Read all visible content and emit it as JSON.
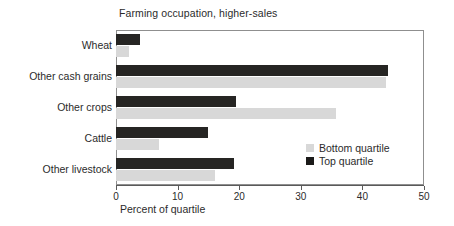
{
  "chart_data": {
    "type": "bar",
    "orientation": "horizontal",
    "title": "Farming occupation, higher-sales",
    "xlabel": "Percent of quartile",
    "ylabel": "",
    "xlim": [
      0,
      50
    ],
    "xticks": [
      0,
      10,
      20,
      30,
      40,
      50
    ],
    "xtick_labels": [
      "0",
      "10",
      "20",
      "30",
      "40",
      "50"
    ],
    "grid": false,
    "legend_position": "inside-right-lower",
    "categories": [
      "Wheat",
      "Other cash grains",
      "Other crops",
      "Cattle",
      "Other livestock"
    ],
    "series": [
      {
        "name": "Top quartile",
        "color": "#262523",
        "values": [
          3.9,
          44.2,
          19.5,
          14.9,
          19.2
        ]
      },
      {
        "name": "Bottom quartile",
        "color": "#d8d8d8",
        "values": [
          2.1,
          43.8,
          35.7,
          7.0,
          16.1
        ]
      }
    ]
  },
  "legend": {
    "entries": [
      {
        "label": "Bottom quartile",
        "series": "Bottom quartile"
      },
      {
        "label": "Top quartile",
        "series": "Top quartile"
      }
    ]
  },
  "colors": {
    "top_quartile": "#262523",
    "bottom_quartile": "#d8d8d8",
    "frame": "#8f8f8f",
    "axis": "#5a5a5a",
    "text": "#2b2b2b",
    "background": "#ffffff"
  }
}
